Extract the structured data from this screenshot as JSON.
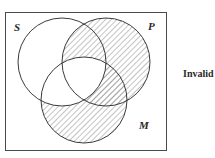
{
  "diagram": {
    "type": "venn-3",
    "sets": [
      {
        "label": "S",
        "cx": 62,
        "cy": 62,
        "r": 44
      },
      {
        "label": "P",
        "cx": 106,
        "cy": 62,
        "r": 44
      },
      {
        "label": "M",
        "cx": 84,
        "cy": 100,
        "r": 43
      }
    ],
    "shaded_regions": [
      "P-only",
      "M-only",
      "S∩P-not-M",
      "P∩M-not-S"
    ],
    "unshaded_regions": [
      "S-only",
      "S∩M-not-P",
      "S∩P∩M"
    ],
    "verdict": "Invalid",
    "colors": {
      "stroke": "#3a3a3a",
      "hatch": "#8a8a8a",
      "background": "#ffffff"
    }
  }
}
